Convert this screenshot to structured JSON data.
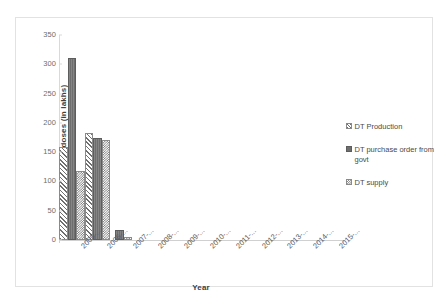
{
  "chart_data": {
    "type": "bar",
    "title": "",
    "xlabel": "Year",
    "ylabel": "Number of doses (in lakhs)",
    "ylim": [
      0,
      350
    ],
    "ytick_step": 50,
    "yticks": [
      0,
      50,
      100,
      150,
      200,
      250,
      300,
      350
    ],
    "ytick_labels": [
      "0",
      "50",
      "100",
      "150",
      "200",
      "250",
      "300",
      "350"
    ],
    "grid": false,
    "legend_position": "right",
    "categories": [
      "2005-...",
      "2006-...",
      "2007-...",
      "2008-...",
      "2009-...",
      "2010-...",
      "2011-...",
      "2012-...",
      "2013-...",
      "2014-...",
      "2015-..."
    ],
    "series": [
      {
        "name": "DT Production",
        "pattern": "diagonal-hatch",
        "values": [
          155,
          180,
          0,
          0,
          0,
          0,
          0,
          0,
          0,
          0,
          0
        ]
      },
      {
        "name": "DT purchase  order from govt",
        "pattern": "solid-dark-gray",
        "values": [
          307,
          170,
          13,
          0,
          0,
          0,
          0,
          0,
          0,
          0,
          0
        ]
      },
      {
        "name": "DT supply",
        "pattern": "checkerboard",
        "values": [
          115,
          168,
          2,
          0,
          0,
          0,
          0,
          0,
          0,
          0,
          0
        ]
      }
    ],
    "colors": {
      "bar_dark": "#6e6e6e",
      "bar_outline": "#8a8a8a",
      "axis_line": "#d9d9d9",
      "tick_text": "#6d6d6d",
      "axis_title_text": "#3f3f3f",
      "frame_border": "#e2e2e2",
      "background": "#ffffff"
    }
  }
}
